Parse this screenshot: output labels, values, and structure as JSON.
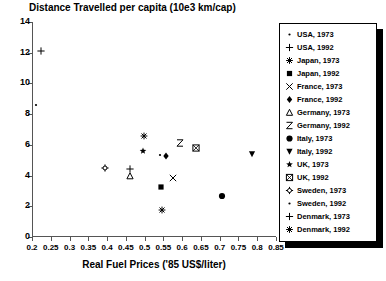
{
  "chart_data": {
    "type": "scatter",
    "title": "Distance Travelled per capita (10e3 km/cap)",
    "xlabel": "Real Fuel Prices ('85 US$/liter)",
    "ylabel": "",
    "xlim": [
      0.2,
      0.85
    ],
    "ylim": [
      0,
      14
    ],
    "xticks": [
      "0.2",
      "0.25",
      "0.3",
      "0.35",
      "0.4",
      "0.45",
      "0.5",
      "0.55",
      "0.6",
      "0.65",
      "0.7",
      "0.75",
      "0.8",
      "0.85"
    ],
    "xtick_values": [
      0.2,
      0.25,
      0.3,
      0.35,
      0.4,
      0.45,
      0.5,
      0.55,
      0.6,
      0.65,
      0.7,
      0.75,
      0.8,
      0.85
    ],
    "yticks": [
      "0",
      "2",
      "4",
      "6",
      "8",
      "10",
      "12",
      "14"
    ],
    "ytick_values": [
      0,
      2,
      4,
      6,
      8,
      10,
      12,
      14
    ],
    "grid": false,
    "legend_position": "right",
    "points": [
      {
        "label": "USA, 1973",
        "marker": "dot",
        "x": 0.21,
        "y": 8.6
      },
      {
        "label": "USA, 1992",
        "marker": "plus",
        "x": 0.225,
        "y": 12.1
      },
      {
        "label": "Japan, 1973",
        "marker": "asterisk",
        "x": 0.545,
        "y": 1.75
      },
      {
        "label": "Japan, 1992",
        "marker": "filled-square",
        "x": 0.543,
        "y": 3.25
      },
      {
        "label": "France, 1973",
        "marker": "cross-x",
        "x": 0.575,
        "y": 3.85
      },
      {
        "label": "France, 1992",
        "marker": "filled-diamond",
        "x": 0.556,
        "y": 5.25
      },
      {
        "label": "Germany, 1973",
        "marker": "open-triangle",
        "x": 0.462,
        "y": 4.0
      },
      {
        "label": "Germany, 1992",
        "marker": "hourglass",
        "x": 0.595,
        "y": 6.15
      },
      {
        "label": "Italy, 1973",
        "marker": "filled-circle",
        "x": 0.705,
        "y": 2.65
      },
      {
        "label": "Italy, 1992",
        "marker": "filled-down-triangle",
        "x": 0.785,
        "y": 5.4
      },
      {
        "label": "UK, 1973",
        "marker": "filled-star",
        "x": 0.497,
        "y": 5.6
      },
      {
        "label": "UK, 1992",
        "marker": "square-x",
        "x": 0.637,
        "y": 5.8
      },
      {
        "label": "Sweden, 1973",
        "marker": "spoked-circle",
        "x": 0.395,
        "y": 4.5
      },
      {
        "label": "Sweden, 1992",
        "marker": "dot",
        "x": 0.54,
        "y": 5.35
      },
      {
        "label": "Denmark, 1973",
        "marker": "plus",
        "x": 0.461,
        "y": 4.4
      },
      {
        "label": "Denmark, 1992",
        "marker": "asterisk",
        "x": 0.498,
        "y": 6.6
      }
    ]
  },
  "legend": {
    "items": [
      {
        "label": "USA, 1973",
        "marker": "dot"
      },
      {
        "label": "USA, 1992",
        "marker": "plus"
      },
      {
        "label": "Japan, 1973",
        "marker": "asterisk"
      },
      {
        "label": "Japan, 1992",
        "marker": "filled-square"
      },
      {
        "label": "France, 1973",
        "marker": "cross-x"
      },
      {
        "label": "France, 1992",
        "marker": "filled-diamond"
      },
      {
        "label": "Germany, 1973",
        "marker": "open-triangle"
      },
      {
        "label": "Germany, 1992",
        "marker": "hourglass"
      },
      {
        "label": "Italy, 1973",
        "marker": "filled-circle"
      },
      {
        "label": "Italy, 1992",
        "marker": "filled-down-triangle"
      },
      {
        "label": "UK, 1973",
        "marker": "filled-star"
      },
      {
        "label": "UK, 1992",
        "marker": "square-x"
      },
      {
        "label": "Sweden, 1973",
        "marker": "spoked-circle"
      },
      {
        "label": "Sweden, 1992",
        "marker": "dot"
      },
      {
        "label": "Denmark, 1973",
        "marker": "plus"
      },
      {
        "label": "Denmark, 1992",
        "marker": "asterisk"
      }
    ]
  },
  "colors": {
    "marker": "#000000",
    "axis": "#555555",
    "background": "#ffffff",
    "legend_shadow": "#000000"
  }
}
